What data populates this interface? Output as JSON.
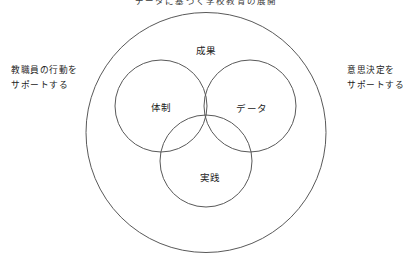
{
  "diagram": {
    "title": "データに基づく学校教育の展開",
    "outer_ring": {
      "name": "outer-boundary-circle"
    },
    "top_label": "成果",
    "circles": [
      {
        "id": "taisei",
        "label": "体制"
      },
      {
        "id": "data",
        "label": "データ"
      },
      {
        "id": "jissen",
        "label": "実践"
      }
    ],
    "side_labels": {
      "left": {
        "line1": "教職員の行動を",
        "line2": "サポートする"
      },
      "right": {
        "line1": "意思決定を",
        "line2": "サポートする"
      }
    },
    "colors": {
      "stroke": "#595959",
      "text": "#222222",
      "background": "#ffffff"
    }
  }
}
